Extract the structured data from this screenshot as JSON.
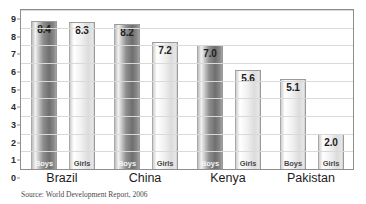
{
  "chart_data": {
    "type": "bar",
    "title": "",
    "xlabel": "",
    "ylabel": "",
    "ylim": [
      0,
      9
    ],
    "ytick_step": 1,
    "ytick_labels": [
      "9",
      "8",
      "7",
      "6",
      "5",
      "4",
      "3",
      "2",
      "1",
      "0"
    ],
    "grid": true,
    "legend_position": "in-bar",
    "categories": [
      "Brazil",
      "China",
      "Kenya",
      "Pakistan"
    ],
    "series": [
      {
        "name": "Boys",
        "values": [
          8.4,
          8.2,
          7.0,
          5.1
        ]
      },
      {
        "name": "Girls",
        "values": [
          8.3,
          7.2,
          5.6,
          2.0
        ]
      }
    ],
    "bars": [
      {
        "category": "Brazil",
        "series": "Boys",
        "value": 8.4,
        "label": "8.4",
        "shade": "dark"
      },
      {
        "category": "Brazil",
        "series": "Girls",
        "value": 8.3,
        "label": "8.3",
        "shade": "light"
      },
      {
        "category": "China",
        "series": "Boys",
        "value": 8.2,
        "label": "8.2",
        "shade": "dark"
      },
      {
        "category": "China",
        "series": "Girls",
        "value": 7.2,
        "label": "7.2",
        "shade": "light"
      },
      {
        "category": "Kenya",
        "series": "Boys",
        "value": 7.0,
        "label": "7.0",
        "shade": "dark"
      },
      {
        "category": "Kenya",
        "series": "Girls",
        "value": 5.6,
        "label": "5.6",
        "shade": "light"
      },
      {
        "category": "Pakistan",
        "series": "Boys",
        "value": 5.1,
        "label": "5.1",
        "shade": "light"
      },
      {
        "category": "Pakistan",
        "series": "Girls",
        "value": 2.0,
        "label": "2.0",
        "shade": "light"
      }
    ],
    "colors": {
      "bar_dark": "#6f6f6f",
      "bar_light": "#e9e9e9",
      "grid": "#d9d9d9",
      "axis": "#8e8e8e",
      "text": "#1d1d1d",
      "background": "#ffffff"
    }
  },
  "source_note": "Source: World Development Report, 2006",
  "clipped_title": ""
}
